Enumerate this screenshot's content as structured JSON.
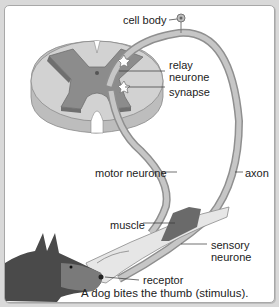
{
  "diagram": {
    "labels": {
      "cell_body": "cell body",
      "relay_neurone_line1": "relay",
      "relay_neurone_line2": "neurone",
      "synapse": "synapse",
      "motor_neurone": "motor neurone",
      "axon": "axon",
      "muscle": "muscle",
      "sensory_neurone_line1": "sensory",
      "sensory_neurone_line2": "neurone",
      "receptor": "receptor"
    },
    "caption": "A dog bites the thumb (stimulus).",
    "colors": {
      "background": "#d9d9d9",
      "panel": "#ffffff",
      "grey_matter": "#8c8c8c",
      "white_matter": "#c8c8c8",
      "nerve": "#a9a9a9",
      "muscle": "#6a6a6a",
      "dog": "#4a4a4a"
    }
  }
}
